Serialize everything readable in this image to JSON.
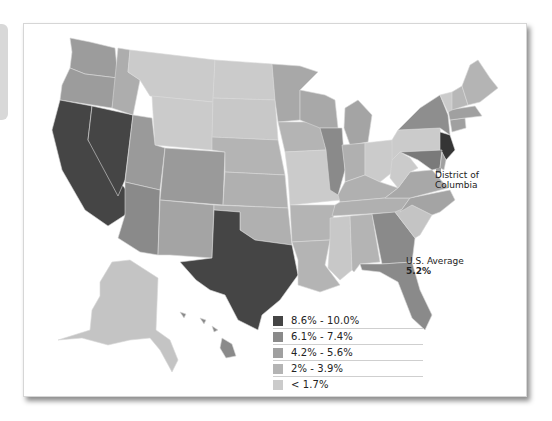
{
  "legend": {
    "items": [
      {
        "label": "8.6% - 10.0%",
        "color": "#454545"
      },
      {
        "label": "6.1% - 7.4%",
        "color": "#8a8a8a"
      },
      {
        "label": "4.2% - 5.6%",
        "color": "#a0a0a0"
      },
      {
        "label": "2% - 3.9%",
        "color": "#b4b4b4"
      },
      {
        "label": "< 1.7%",
        "color": "#cbcbcb"
      }
    ]
  },
  "annotations": {
    "dc_label_line1": "District of",
    "dc_label_line2": "Columbia",
    "dc_color": "#a0a0a0",
    "us_average_label": "U.S. Average",
    "us_average_value": "5.2%"
  },
  "states": {
    "WA": "#9c9c9c",
    "OR": "#9c9c9c",
    "CA": "#454545",
    "NV": "#454545",
    "ID": "#adadad",
    "MT": "#cbcbcb",
    "WY": "#cbcbcb",
    "UT": "#9a9a9a",
    "AZ": "#8a8a8a",
    "CO": "#9a9a9a",
    "NM": "#a4a4a4",
    "TX": "#454545",
    "ND": "#cbcbcb",
    "SD": "#c8c8c8",
    "NE": "#b4b4b4",
    "KS": "#b0b0b0",
    "OK": "#b0b0b0",
    "MN": "#a8a8a8",
    "IA": "#b4b4b4",
    "MO": "#cbcbcb",
    "AR": "#b4b4b4",
    "LA": "#b4b4b4",
    "WI": "#a8a8a8",
    "IL": "#8a8a8a",
    "MI": "#a4a4a4",
    "IN": "#b0b0b0",
    "OH": "#cbcbcb",
    "KY": "#b0b0b0",
    "TN": "#b0b0b0",
    "MS": "#c8c8c8",
    "AL": "#b4b4b4",
    "GA": "#8a8a8a",
    "FL": "#8a8a8a",
    "SC": "#c4c4c4",
    "NC": "#a4a4a4",
    "VA": "#a8a8a8",
    "WV": "#cbcbcb",
    "PA": "#cbcbcb",
    "NY": "#8e8e8e",
    "NJ": "#353535",
    "MD": "#7a7a7a",
    "DE": "#a0a0a0",
    "CT": "#a0a0a0",
    "MA": "#a0a0a0",
    "VT": "#cbcbcb",
    "NH": "#b8b8b8",
    "ME": "#b4b4b4",
    "AK": "#c4c4c4",
    "HI": "#8a8a8a"
  }
}
